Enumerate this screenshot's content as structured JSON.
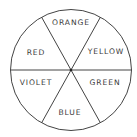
{
  "diagram": {
    "type": "color-wheel",
    "segments": [
      {
        "label": "ORANGE",
        "position": "top"
      },
      {
        "label": "YELLOW",
        "position": "upper-right"
      },
      {
        "label": "GREEN",
        "position": "lower-right"
      },
      {
        "label": "BLUE",
        "position": "bottom"
      },
      {
        "label": "VIOLET",
        "position": "lower-left"
      },
      {
        "label": "RED",
        "position": "upper-left"
      }
    ],
    "colors": {
      "line": "#444444",
      "text": "#3a3a3a",
      "background": "#ffffff"
    }
  }
}
